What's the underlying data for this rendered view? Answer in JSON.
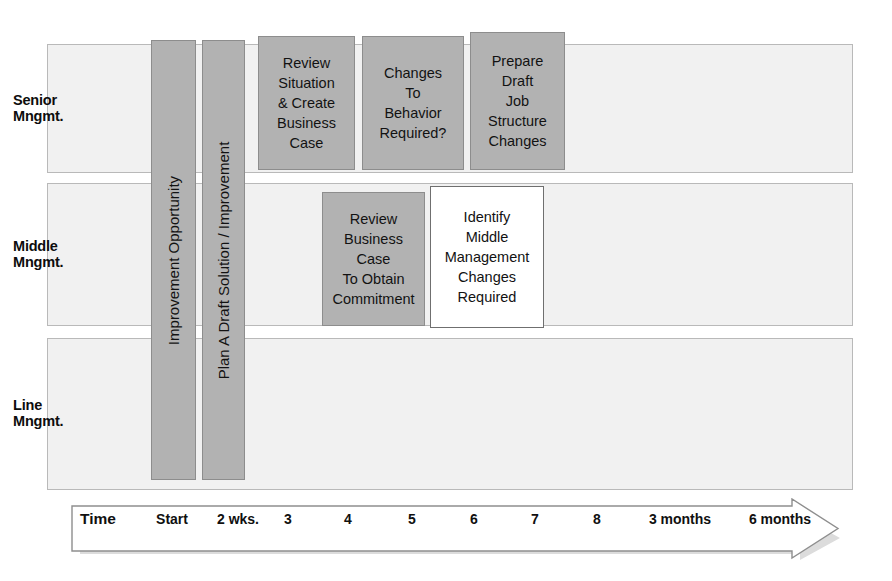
{
  "diagram": {
    "colors": {
      "lane_fill": "#f1f1f1",
      "lane_border": "#b9b9b9",
      "box_grey": "#b2b2b2",
      "box_grey_border": "#8d8d8d",
      "box_white": "#ffffff",
      "box_white_border": "#6f6f6f",
      "text": "#121212",
      "arrow_shadow": "#d8d8d8"
    }
  },
  "lanes": [
    {
      "id": "senior",
      "label": "Senior\nMngmt.",
      "top": 44,
      "height": 129
    },
    {
      "id": "middle",
      "label": "Middle\nMngmt.",
      "top": 183,
      "height": 143
    },
    {
      "id": "line",
      "label": "Line\nMngmt.",
      "top": 338,
      "height": 152
    }
  ],
  "columns": [
    {
      "id": "improvement-opportunity",
      "label": "Improvement Opportunity",
      "left": 151,
      "top": 40,
      "width": 45,
      "height": 440
    },
    {
      "id": "plan-draft-solution",
      "label": "Plan A Draft Solution / Improvement",
      "left": 202,
      "top": 40,
      "width": 43,
      "height": 440
    }
  ],
  "tasks": [
    {
      "id": "review-situation-create-business-case",
      "lane": "senior",
      "style": "grey",
      "label": "Review\nSituation\n& Create\nBusiness\nCase",
      "left": 258,
      "top": 36,
      "width": 97,
      "height": 134
    },
    {
      "id": "changes-to-behavior-required",
      "lane": "senior",
      "style": "grey",
      "label": "Changes\nTo\nBehavior\nRequired?",
      "left": 362,
      "top": 36,
      "width": 102,
      "height": 134
    },
    {
      "id": "prepare-draft-job-structure-changes",
      "lane": "senior",
      "style": "grey",
      "label": "Prepare\nDraft\nJob\nStructure\nChanges",
      "left": 470,
      "top": 32,
      "width": 95,
      "height": 138
    },
    {
      "id": "review-business-case-obtain-commitment",
      "lane": "middle",
      "style": "grey",
      "label": "Review\nBusiness Case\nTo Obtain\nCommitment",
      "left": 322,
      "top": 192,
      "width": 103,
      "height": 134
    },
    {
      "id": "identify-middle-management-changes-required",
      "lane": "middle",
      "style": "white",
      "label": "Identify\nMiddle\nManagement\nChanges\nRequired",
      "left": 430,
      "top": 186,
      "width": 114,
      "height": 142
    }
  ],
  "timeline": {
    "axis_label": "Time",
    "ticks": [
      {
        "label": "Time",
        "x": 28,
        "emphasis": "big"
      },
      {
        "label": "Start",
        "x": 102,
        "emphasis": "normal"
      },
      {
        "label": "2 wks.",
        "x": 168,
        "emphasis": "normal"
      },
      {
        "label": "3",
        "x": 218,
        "emphasis": "normal"
      },
      {
        "label": "4",
        "x": 278,
        "emphasis": "normal"
      },
      {
        "label": "5",
        "x": 342,
        "emphasis": "normal"
      },
      {
        "label": "6",
        "x": 404,
        "emphasis": "normal"
      },
      {
        "label": "7",
        "x": 465,
        "emphasis": "normal"
      },
      {
        "label": "8",
        "x": 527,
        "emphasis": "normal"
      },
      {
        "label": "3 months",
        "x": 610,
        "emphasis": "normal"
      },
      {
        "label": "6 months",
        "x": 710,
        "emphasis": "normal"
      }
    ]
  }
}
